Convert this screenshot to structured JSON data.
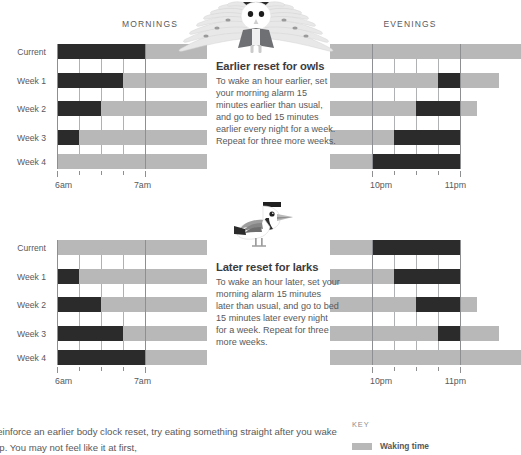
{
  "colors": {
    "waking": "#b8b8b8",
    "sleeping": "#2b2b2b",
    "text": "#58595b",
    "axis": "#8e8f91"
  },
  "row_labels": [
    "Current",
    "Week 1",
    "Week 2",
    "Week 3",
    "Week 4"
  ],
  "headers": {
    "mornings": "MORNINGS",
    "evenings": "EVENINGS"
  },
  "axis": {
    "morning_start": "6am",
    "morning_end": "7am",
    "evening_start": "10pm",
    "evening_end": "11pm"
  },
  "sections": [
    {
      "id": "owls",
      "title": "Earlier reset for owls",
      "body": "To wake an hour earlier, set your morning alarm 15 minutes earlier than usual, and go to bed 15 minutes earlier every night for a week. Repeat for three more weeks.",
      "illustration": "owl-icon"
    },
    {
      "id": "larks",
      "title": "Later reset for larks",
      "body": "To wake an hour later, set your morning alarm 15 minutes later than usual, and go to bed 15 minutes later every night for a week. Repeat for three more weeks.",
      "illustration": "lark-icon"
    }
  ],
  "footer": {
    "text": "reinforce an earlier body clock reset, try eating something straight after you wake up. You may not feel like it at first,",
    "key_title": "KEY",
    "key_label": "Waking time"
  },
  "chart_data": [
    {
      "id": "owls-mornings",
      "type": "bar",
      "title": "MORNINGS",
      "orientation": "horizontal",
      "categories": [
        "Current",
        "Week 1",
        "Week 2",
        "Week 3",
        "Week 4"
      ],
      "xlabel": "",
      "ylabel": "",
      "axis_ticks": [
        "6am",
        "7am"
      ],
      "axis_range_minutes": [
        0,
        60
      ],
      "tick_interval_minutes": 15,
      "grid": true,
      "series": [
        {
          "name": "Sleeping time",
          "color": "#2b2b2b",
          "anchor": "left",
          "values_minutes": [
            60,
            45,
            30,
            15,
            0
          ]
        },
        {
          "name": "Waking time",
          "color": "#b8b8b8",
          "anchor": "after-sleep",
          "values_minutes": [
            42,
            57,
            72,
            87,
            102
          ]
        }
      ]
    },
    {
      "id": "owls-evenings",
      "type": "bar",
      "title": "EVENINGS",
      "orientation": "horizontal",
      "categories": [
        "Current",
        "Week 1",
        "Week 2",
        "Week 3",
        "Week 4"
      ],
      "axis_ticks": [
        "10pm",
        "11pm"
      ],
      "axis_range_minutes": [
        0,
        60
      ],
      "tick_interval_minutes": 15,
      "grid": true,
      "series": [
        {
          "name": "Sleeping time",
          "color": "#2b2b2b",
          "anchor": "right",
          "values_minutes": [
            0,
            15,
            30,
            45,
            60
          ]
        },
        {
          "name": "Waking time",
          "color": "#b8b8b8",
          "anchor": "left",
          "values_minutes": [
            130,
            115,
            100,
            85,
            70
          ]
        }
      ]
    },
    {
      "id": "larks-mornings",
      "type": "bar",
      "title": "MORNINGS",
      "orientation": "horizontal",
      "categories": [
        "Current",
        "Week 1",
        "Week 2",
        "Week 3",
        "Week 4"
      ],
      "axis_ticks": [
        "6am",
        "7am"
      ],
      "axis_range_minutes": [
        0,
        60
      ],
      "tick_interval_minutes": 15,
      "grid": true,
      "series": [
        {
          "name": "Sleeping time",
          "color": "#2b2b2b",
          "anchor": "left",
          "values_minutes": [
            0,
            15,
            30,
            45,
            60
          ]
        },
        {
          "name": "Waking time",
          "color": "#b8b8b8",
          "anchor": "after-sleep",
          "values_minutes": [
            102,
            87,
            72,
            57,
            42
          ]
        }
      ]
    },
    {
      "id": "larks-evenings",
      "type": "bar",
      "title": "EVENINGS",
      "orientation": "horizontal",
      "categories": [
        "Current",
        "Week 1",
        "Week 2",
        "Week 3",
        "Week 4"
      ],
      "axis_ticks": [
        "10pm",
        "11pm"
      ],
      "axis_range_minutes": [
        0,
        60
      ],
      "tick_interval_minutes": 15,
      "grid": true,
      "series": [
        {
          "name": "Sleeping time",
          "color": "#2b2b2b",
          "anchor": "right",
          "values_minutes": [
            60,
            45,
            30,
            15,
            0
          ]
        },
        {
          "name": "Waking time",
          "color": "#b8b8b8",
          "anchor": "left",
          "values_minutes": [
            70,
            85,
            100,
            115,
            130
          ]
        }
      ]
    }
  ]
}
